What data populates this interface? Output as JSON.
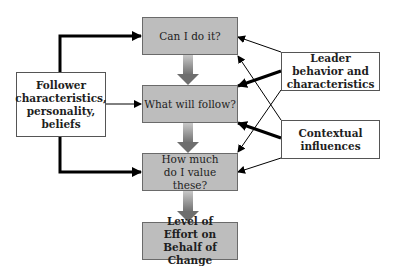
{
  "diagram": {
    "steps": [
      {
        "id": "can",
        "label": "Can I do it?"
      },
      {
        "id": "follow",
        "label": "What will follow?"
      },
      {
        "id": "value",
        "label": "How much do I value these?"
      },
      {
        "id": "effort",
        "label": "Level of Effort on Behalf of Change"
      }
    ],
    "inputs": {
      "follower": {
        "label": "Follower characteristics, personality, beliefs"
      },
      "leader": {
        "label": "Leader behavior and characteristics"
      },
      "context": {
        "label": "Contextual influences"
      }
    },
    "colors": {
      "step_fill": "#bdbdbd",
      "step_border": "#6a6a6a",
      "arrow": "#000000",
      "flow_arrow": "#7a7a7a"
    }
  }
}
